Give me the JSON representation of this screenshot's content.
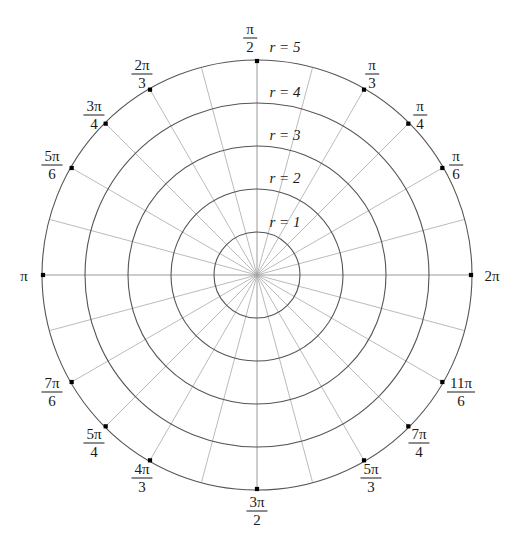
{
  "figure": {
    "name": "polar-coordinate-grid",
    "type": "polar-grid",
    "center": {
      "x": 257,
      "y": 275
    },
    "outer_radius": 214,
    "ring_spacing": 43,
    "colors": {
      "circle_stroke": "#555555",
      "spoke_stroke": "#bbbbbb",
      "axis_stroke": "#9a9a9a",
      "dot_fill": "#000000",
      "text": "#1a1a1a",
      "background": "#ffffff"
    }
  },
  "chart_data": {
    "type": "polar-grid",
    "title": "",
    "radial_ticks": [
      1,
      2,
      3,
      4,
      5
    ],
    "radial_tick_labels": [
      "r = 1",
      "r = 2",
      "r = 3",
      "r = 4",
      "r = 5"
    ],
    "rlim": [
      0,
      5
    ],
    "angular_tick_count": 24,
    "angular_ticks_deg": [
      0,
      15,
      30,
      45,
      60,
      75,
      90,
      105,
      120,
      135,
      150,
      165,
      180,
      195,
      210,
      225,
      240,
      255,
      270,
      285,
      300,
      315,
      330,
      345
    ],
    "labeled_angles": [
      {
        "deg": 0,
        "num": "2",
        "den": "",
        "plain": "2π",
        "kind": "plain"
      },
      {
        "deg": 30,
        "num": "π",
        "den": "6",
        "plain": "",
        "kind": "frac"
      },
      {
        "deg": 45,
        "num": "π",
        "den": "4",
        "plain": "",
        "kind": "frac"
      },
      {
        "deg": 60,
        "num": "π",
        "den": "3",
        "plain": "",
        "kind": "frac"
      },
      {
        "deg": 90,
        "num": "π",
        "den": "2",
        "plain": "",
        "kind": "frac"
      },
      {
        "deg": 120,
        "num": "2π",
        "den": "3",
        "plain": "",
        "kind": "frac"
      },
      {
        "deg": 135,
        "num": "3π",
        "den": "4",
        "plain": "",
        "kind": "frac"
      },
      {
        "deg": 150,
        "num": "5π",
        "den": "6",
        "plain": "",
        "kind": "frac"
      },
      {
        "deg": 180,
        "num": "",
        "den": "",
        "plain": "π",
        "kind": "plain"
      },
      {
        "deg": 210,
        "num": "7π",
        "den": "6",
        "plain": "",
        "kind": "frac"
      },
      {
        "deg": 225,
        "num": "5π",
        "den": "4",
        "plain": "",
        "kind": "frac"
      },
      {
        "deg": 240,
        "num": "4π",
        "den": "3",
        "plain": "",
        "kind": "frac"
      },
      {
        "deg": 270,
        "num": "3π",
        "den": "2",
        "plain": "",
        "kind": "frac"
      },
      {
        "deg": 300,
        "num": "5π",
        "den": "3",
        "plain": "",
        "kind": "frac"
      },
      {
        "deg": 315,
        "num": "7π",
        "den": "4",
        "plain": "",
        "kind": "frac"
      },
      {
        "deg": 330,
        "num": "11π",
        "den": "6",
        "plain": "",
        "kind": "frac"
      }
    ],
    "grid": true,
    "legend": "none"
  },
  "angle_labels": [
    {
      "id": "angle-label-pi-2",
      "num": "π",
      "den": "2",
      "plain": "",
      "left": 250,
      "top": 38,
      "kind": "frac"
    },
    {
      "id": "angle-label-pi-3",
      "num": "π",
      "den": "3",
      "plain": "",
      "left": 372,
      "top": 74,
      "kind": "frac"
    },
    {
      "id": "angle-label-pi-4",
      "num": "π",
      "den": "4",
      "plain": "",
      "left": 420,
      "top": 115,
      "kind": "frac"
    },
    {
      "id": "angle-label-pi-6",
      "num": "π",
      "den": "6",
      "plain": "",
      "left": 456,
      "top": 165,
      "kind": "frac"
    },
    {
      "id": "angle-label-2pi",
      "num": "",
      "den": "",
      "plain": "2π",
      "left": 492,
      "top": 276,
      "kind": "plain"
    },
    {
      "id": "angle-label-11pi-6",
      "num": "11π",
      "den": "6",
      "plain": "",
      "left": 461,
      "top": 392,
      "kind": "frac"
    },
    {
      "id": "angle-label-7pi-4",
      "num": "7π",
      "den": "4",
      "plain": "",
      "left": 419,
      "top": 443,
      "kind": "frac"
    },
    {
      "id": "angle-label-5pi-3",
      "num": "5π",
      "den": "3",
      "plain": "",
      "left": 371,
      "top": 478,
      "kind": "frac"
    },
    {
      "id": "angle-label-3pi-2",
      "num": "3π",
      "den": "2",
      "plain": "",
      "left": 257,
      "top": 511,
      "kind": "frac"
    },
    {
      "id": "angle-label-4pi-3",
      "num": "4π",
      "den": "3",
      "plain": "",
      "left": 142,
      "top": 478,
      "kind": "frac"
    },
    {
      "id": "angle-label-5pi-4",
      "num": "5π",
      "den": "4",
      "plain": "",
      "left": 94,
      "top": 443,
      "kind": "frac"
    },
    {
      "id": "angle-label-7pi-6",
      "num": "7π",
      "den": "6",
      "plain": "",
      "left": 52,
      "top": 392,
      "kind": "frac"
    },
    {
      "id": "angle-label-pi",
      "num": "",
      "den": "",
      "plain": "π",
      "left": 24,
      "top": 276,
      "kind": "plain"
    },
    {
      "id": "angle-label-5pi-6",
      "num": "5π",
      "den": "6",
      "plain": "",
      "left": 52,
      "top": 165,
      "kind": "frac"
    },
    {
      "id": "angle-label-3pi-4",
      "num": "3π",
      "den": "4",
      "plain": "",
      "left": 94,
      "top": 115,
      "kind": "frac"
    },
    {
      "id": "angle-label-2pi-3",
      "num": "2π",
      "den": "3",
      "plain": "",
      "left": 142,
      "top": 74,
      "kind": "frac"
    }
  ],
  "radius_labels": [
    {
      "id": "radius-label-5",
      "text": "r = 5",
      "left": 285,
      "top": 47
    },
    {
      "id": "radius-label-4",
      "text": "r = 4",
      "left": 285,
      "top": 92
    },
    {
      "id": "radius-label-3",
      "text": "r = 3",
      "left": 285,
      "top": 135
    },
    {
      "id": "radius-label-2",
      "text": "r = 2",
      "left": 285,
      "top": 178
    },
    {
      "id": "radius-label-1",
      "text": "r = 1",
      "left": 285,
      "top": 222
    }
  ]
}
